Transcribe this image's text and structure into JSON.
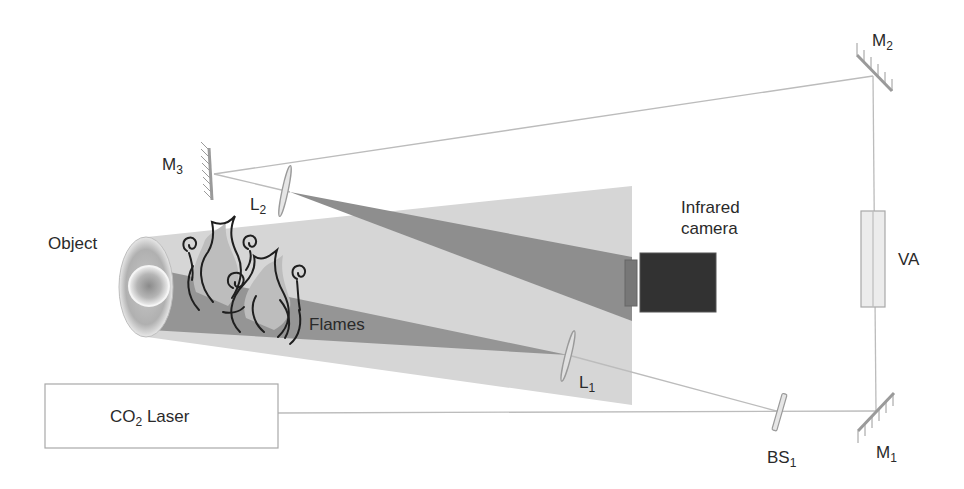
{
  "figure": {
    "type": "optical setup schematic",
    "colors": {
      "background": "#ffffff",
      "wide_beam": "#d6d6d6",
      "focused_beam": "#8c8c8c",
      "camera_body": "#333333",
      "camera_window": "#777777",
      "optics": "#9a9a9a",
      "beam_line": "#b8b8b8",
      "flame_outline": "#222222",
      "label_text": "#2a2a2a"
    }
  },
  "labels": {
    "m2": {
      "main": "M",
      "sub": "2"
    },
    "m3": {
      "main": "M",
      "sub": "3"
    },
    "l2": {
      "main": "L",
      "sub": "2"
    },
    "l1": {
      "main": "L",
      "sub": "1"
    },
    "m1": {
      "main": "M",
      "sub": "1"
    },
    "bs1": {
      "main": "BS",
      "sub": "1"
    },
    "object": "Object",
    "flames": "Flames",
    "camera_line1": "Infrared",
    "camera_line2": "camera",
    "va": "VA",
    "laser": {
      "pre": "CO",
      "sub": "2",
      "post": " Laser"
    }
  },
  "components": [
    {
      "id": "co2-laser",
      "label": "CO2 Laser"
    },
    {
      "id": "bs1",
      "label": "BS1",
      "kind": "beam splitter"
    },
    {
      "id": "m1",
      "label": "M1",
      "kind": "mirror"
    },
    {
      "id": "va",
      "label": "VA",
      "kind": "variable attenuator"
    },
    {
      "id": "m2",
      "label": "M2",
      "kind": "mirror"
    },
    {
      "id": "m3",
      "label": "M3",
      "kind": "mirror"
    },
    {
      "id": "l2",
      "label": "L2",
      "kind": "lens"
    },
    {
      "id": "l1",
      "label": "L1",
      "kind": "lens"
    },
    {
      "id": "object",
      "label": "Object"
    },
    {
      "id": "flames",
      "label": "Flames"
    },
    {
      "id": "infrared-camera",
      "label": "Infrared camera"
    }
  ]
}
